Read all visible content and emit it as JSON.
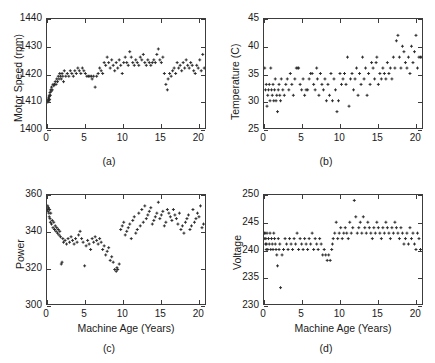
{
  "figure": {
    "background": "#ffffff",
    "marker_color": "#2b2b2b",
    "axis_color": "#3c3c3c"
  },
  "chart_data": [
    {
      "type": "scatter",
      "panel": "a",
      "caption": "(a)",
      "title": "",
      "xlabel": "",
      "ylabel": "Motor Speed (rpm)",
      "xlim": [
        0,
        21
      ],
      "ylim": [
        1400,
        1440
      ],
      "xticks": [
        0,
        5,
        10,
        15,
        20
      ],
      "yticks": [
        1400,
        1410,
        1420,
        1430,
        1440
      ],
      "grid": false,
      "legend": null,
      "x": [
        0.1,
        0.15,
        0.2,
        0.2,
        0.25,
        0.3,
        0.3,
        0.35,
        0.4,
        0.45,
        0.5,
        0.55,
        0.6,
        0.7,
        0.8,
        0.9,
        1.0,
        1.1,
        1.2,
        1.3,
        1.4,
        1.5,
        1.6,
        1.7,
        1.8,
        1.9,
        2.0,
        2.1,
        2.2,
        2.3,
        2.5,
        2.7,
        2.9,
        3.1,
        3.3,
        3.5,
        3.7,
        3.9,
        4.1,
        4.3,
        4.5,
        4.7,
        4.9,
        5.1,
        5.3,
        5.5,
        5.7,
        5.9,
        6.0,
        6.2,
        6.4,
        6.6,
        6.8,
        7.0,
        7.2,
        7.4,
        7.6,
        7.8,
        8.0,
        8.2,
        8.4,
        8.6,
        8.8,
        9.0,
        9.2,
        9.4,
        9.6,
        9.8,
        10.0,
        10.2,
        10.4,
        10.6,
        10.8,
        11.0,
        11.2,
        11.4,
        11.6,
        11.8,
        12.0,
        12.2,
        12.4,
        12.6,
        12.8,
        13.0,
        13.2,
        13.4,
        13.6,
        13.8,
        14.0,
        14.2,
        14.4,
        14.6,
        14.8,
        15.0,
        15.2,
        15.4,
        15.6,
        15.8,
        16.0,
        16.1,
        16.3,
        16.5,
        16.7,
        16.9,
        17.1,
        17.3,
        17.5,
        17.7,
        17.9,
        18.1,
        18.3,
        18.5,
        18.7,
        18.9,
        19.1,
        19.3,
        19.5,
        19.7,
        19.9,
        20.1,
        20.3,
        20.5,
        20.7,
        20.9
      ],
      "y": [
        1409.5,
        1410,
        1410.5,
        1411,
        1410,
        1411.5,
        1412,
        1410.5,
        1413,
        1412,
        1414,
        1413.5,
        1415,
        1414,
        1416,
        1415.5,
        1416,
        1417,
        1416,
        1418,
        1417,
        1419,
        1418,
        1420,
        1419,
        1418,
        1420,
        1419,
        1417,
        1421,
        1419,
        1420,
        1419,
        1421,
        1420,
        1419,
        1421,
        1420,
        1422,
        1421,
        1420,
        1422,
        1421,
        1420,
        1419,
        1419,
        1419,
        1419,
        1418,
        1419,
        1415,
        1419,
        1420,
        1422,
        1421,
        1420,
        1424,
        1423,
        1426,
        1424,
        1422,
        1425,
        1423,
        1421,
        1424,
        1422,
        1425,
        1423,
        1420,
        1424,
        1426,
        1424,
        1423,
        1428,
        1426,
        1424,
        1423,
        1425,
        1424,
        1423,
        1426,
        1425,
        1427,
        1424,
        1423,
        1425,
        1424,
        1423,
        1424,
        1425,
        1424,
        1427,
        1429,
        1425,
        1424,
        1426,
        1420,
        1416,
        1414,
        1418,
        1420,
        1419,
        1421,
        1422,
        1420,
        1424,
        1422,
        1423,
        1421,
        1424,
        1422,
        1425,
        1423,
        1422,
        1424,
        1423,
        1421,
        1420,
        1423,
        1422,
        1425,
        1421,
        1427,
        1422
      ]
    },
    {
      "type": "scatter",
      "panel": "b",
      "caption": "(b)",
      "title": "",
      "xlabel": "",
      "ylabel": "Temperature (C)",
      "xlim": [
        0,
        21
      ],
      "ylim": [
        25,
        45
      ],
      "xticks": [
        0,
        5,
        10,
        15,
        20
      ],
      "yticks": [
        25,
        30,
        35,
        40,
        45
      ],
      "grid": false,
      "legend": null,
      "x": [
        0.1,
        0.2,
        0.3,
        0.4,
        0.5,
        0.6,
        0.7,
        0.8,
        0.9,
        1.0,
        1.1,
        1.2,
        1.3,
        1.4,
        1.5,
        1.6,
        1.7,
        1.8,
        1.9,
        2.0,
        2.1,
        2.2,
        2.3,
        2.5,
        2.7,
        2.9,
        3.1,
        3.3,
        3.5,
        3.7,
        3.9,
        4.1,
        4.3,
        4.5,
        4.6,
        4.8,
        5.0,
        5.2,
        5.4,
        5.6,
        5.8,
        6.0,
        6.2,
        6.4,
        6.6,
        6.8,
        7.0,
        7.1,
        7.3,
        7.5,
        7.7,
        7.9,
        8.1,
        8.3,
        8.5,
        8.7,
        8.9,
        9.1,
        9.3,
        9.5,
        9.7,
        9.9,
        10.1,
        10.3,
        10.5,
        10.7,
        10.9,
        11.1,
        11.3,
        11.5,
        11.7,
        11.9,
        12.1,
        12.3,
        12.5,
        12.7,
        12.9,
        13.1,
        13.3,
        13.5,
        13.7,
        13.9,
        14.1,
        14.3,
        14.5,
        14.7,
        14.9,
        15.0,
        15.2,
        15.4,
        15.6,
        15.8,
        16.0,
        16.2,
        16.4,
        16.6,
        16.8,
        17.0,
        17.2,
        17.4,
        17.6,
        17.8,
        18.0,
        18.2,
        18.4,
        18.6,
        18.8,
        19.0,
        19.2,
        19.4,
        19.6,
        19.8,
        20.0,
        20.2,
        20.4,
        20.6,
        20.8,
        21.0
      ],
      "y": [
        36,
        32,
        33,
        29,
        31,
        32,
        33,
        30,
        36,
        32,
        31,
        33,
        30,
        32,
        34,
        30,
        31,
        28,
        32,
        33,
        31,
        30,
        34,
        32,
        31,
        33,
        34,
        32,
        35,
        33,
        31,
        34,
        36,
        36,
        36,
        33,
        32,
        34,
        31,
        32,
        32,
        34,
        35,
        35,
        33,
        32,
        36,
        34,
        31,
        35,
        33,
        32,
        34,
        30,
        33,
        31,
        35,
        30,
        34,
        32,
        28,
        30,
        35,
        33,
        34,
        35,
        33,
        38,
        29,
        34,
        35,
        32,
        34,
        36,
        31,
        35,
        33,
        38,
        34,
        36,
        31,
        35,
        33,
        37,
        36,
        34,
        37,
        38,
        33,
        35,
        34,
        36,
        35,
        34,
        37,
        35,
        36,
        34,
        38,
        36,
        41,
        42,
        38,
        36,
        40,
        39,
        37,
        36,
        38,
        35,
        40,
        37,
        39,
        42,
        36,
        38,
        38,
        38
      ]
    },
    {
      "type": "scatter",
      "panel": "c",
      "caption": "(c)",
      "title": "",
      "xlabel": "Machine Age (Years)",
      "ylabel": "Power",
      "xlim": [
        0,
        21
      ],
      "ylim": [
        300,
        360
      ],
      "xticks": [
        0,
        5,
        10,
        15,
        20
      ],
      "yticks": [
        300,
        320,
        340,
        360
      ],
      "grid": false,
      "legend": null,
      "x": [
        0.05,
        0.1,
        0.15,
        0.2,
        0.25,
        0.3,
        0.35,
        0.4,
        0.45,
        0.5,
        0.6,
        0.7,
        0.8,
        0.9,
        1.0,
        1.1,
        1.2,
        1.3,
        1.4,
        1.5,
        1.6,
        1.7,
        1.8,
        1.9,
        2.0,
        2.1,
        2.2,
        2.4,
        2.6,
        2.8,
        3.0,
        3.2,
        3.4,
        3.6,
        3.8,
        4.0,
        4.2,
        4.4,
        4.6,
        4.8,
        5.0,
        5.2,
        5.4,
        5.6,
        5.8,
        6.0,
        6.2,
        6.4,
        6.6,
        6.8,
        7.0,
        7.2,
        7.4,
        7.6,
        7.8,
        8.0,
        8.2,
        8.4,
        8.6,
        8.8,
        9.0,
        9.2,
        9.3,
        9.4,
        9.6,
        9.8,
        10.0,
        10.2,
        10.4,
        10.6,
        10.8,
        11.0,
        11.2,
        11.4,
        11.6,
        11.8,
        12.0,
        12.2,
        12.4,
        12.6,
        12.8,
        13.0,
        13.2,
        13.4,
        13.6,
        13.8,
        14.0,
        14.2,
        14.4,
        14.6,
        14.8,
        15.0,
        15.2,
        15.4,
        15.6,
        15.8,
        16.0,
        16.2,
        16.4,
        16.6,
        16.8,
        17.0,
        17.2,
        17.4,
        17.6,
        17.8,
        18.0,
        18.2,
        18.4,
        18.6,
        18.8,
        19.0,
        19.2,
        19.4,
        19.6,
        19.8,
        20.0,
        20.2,
        20.4,
        20.6,
        20.8
      ],
      "y": [
        352,
        354,
        351,
        353,
        350,
        348,
        352,
        347,
        345,
        350,
        344,
        346,
        342,
        345,
        341,
        343,
        340,
        342,
        339,
        341,
        338,
        340,
        337,
        322,
        323,
        336,
        334,
        335,
        333,
        336,
        334,
        337,
        335,
        333,
        336,
        334,
        338,
        340,
        336,
        334,
        321,
        332,
        335,
        333,
        330,
        336,
        334,
        337,
        335,
        333,
        336,
        334,
        330,
        332,
        327,
        329,
        331,
        324,
        326,
        323,
        319,
        318,
        320,
        319,
        322,
        341,
        343,
        345,
        338,
        340,
        342,
        344,
        336,
        346,
        348,
        339,
        341,
        350,
        343,
        352,
        345,
        354,
        347,
        349,
        351,
        353,
        344,
        346,
        348,
        350,
        356,
        347,
        349,
        351,
        343,
        345,
        352,
        350,
        348,
        346,
        352,
        349,
        347,
        344,
        350,
        341,
        343,
        339,
        345,
        347,
        349,
        341,
        343,
        352,
        345,
        347,
        350,
        348,
        354,
        342,
        344
      ]
    },
    {
      "type": "scatter",
      "panel": "d",
      "caption": "(d)",
      "title": "",
      "xlabel": "Machine Age (Years)",
      "ylabel": "Voltage",
      "xlim": [
        0,
        21
      ],
      "ylim": [
        230,
        250
      ],
      "xticks": [
        0,
        5,
        10,
        15,
        20
      ],
      "yticks": [
        230,
        235,
        240,
        245,
        250
      ],
      "grid": false,
      "legend": null,
      "x": [
        0.05,
        0.1,
        0.15,
        0.2,
        0.25,
        0.3,
        0.35,
        0.4,
        0.5,
        0.6,
        0.7,
        0.8,
        0.9,
        1.0,
        1.1,
        1.2,
        1.3,
        1.4,
        1.5,
        1.6,
        1.7,
        1.8,
        1.9,
        2.0,
        2.1,
        2.2,
        2.4,
        2.6,
        2.8,
        3.0,
        3.2,
        3.4,
        3.6,
        3.8,
        4.0,
        4.2,
        4.4,
        4.6,
        4.8,
        5.0,
        5.2,
        5.4,
        5.6,
        5.8,
        6.0,
        6.2,
        6.4,
        6.6,
        6.8,
        7.0,
        7.2,
        7.4,
        7.6,
        7.8,
        8.0,
        8.2,
        8.4,
        8.6,
        8.8,
        9.0,
        9.1,
        9.2,
        9.4,
        9.6,
        9.8,
        10.0,
        10.2,
        10.4,
        10.6,
        10.8,
        11.0,
        11.2,
        11.4,
        11.6,
        11.8,
        12.0,
        12.2,
        12.4,
        12.6,
        12.8,
        13.0,
        13.2,
        13.4,
        13.6,
        13.8,
        14.0,
        14.2,
        14.4,
        14.6,
        14.8,
        15.0,
        15.2,
        15.4,
        15.6,
        15.8,
        16.0,
        16.2,
        16.4,
        16.6,
        16.8,
        17.0,
        17.2,
        17.4,
        17.6,
        17.8,
        18.0,
        18.2,
        18.4,
        18.6,
        18.8,
        19.0,
        19.2,
        19.4,
        19.6,
        19.8,
        20.0,
        20.2,
        20.4,
        20.6,
        20.8
      ],
      "y": [
        243,
        242,
        243,
        241,
        242,
        240,
        241,
        243,
        240,
        242,
        241,
        243,
        240,
        242,
        241,
        240,
        243,
        242,
        241,
        240,
        239,
        237,
        242,
        240,
        241,
        233,
        239,
        240,
        242,
        241,
        240,
        242,
        241,
        240,
        242,
        241,
        243,
        240,
        242,
        241,
        240,
        242,
        241,
        240,
        242,
        241,
        243,
        240,
        242,
        241,
        240,
        242,
        241,
        239,
        240,
        239,
        238,
        239,
        238,
        240,
        241,
        242,
        243,
        245,
        242,
        243,
        244,
        242,
        243,
        244,
        243,
        242,
        245,
        243,
        244,
        249,
        246,
        243,
        244,
        245,
        243,
        246,
        244,
        243,
        245,
        244,
        243,
        242,
        244,
        243,
        245,
        244,
        243,
        242,
        244,
        243,
        245,
        244,
        243,
        242,
        244,
        243,
        245,
        244,
        243,
        242,
        244,
        243,
        241,
        242,
        243,
        241,
        244,
        242,
        243,
        241,
        240,
        243,
        242,
        240
      ]
    }
  ]
}
